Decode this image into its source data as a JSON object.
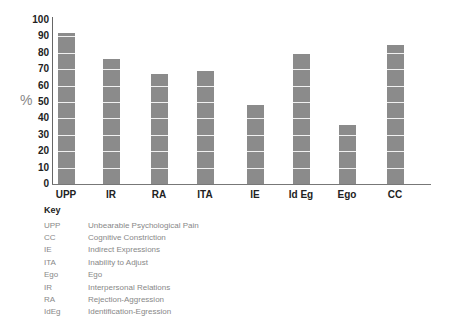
{
  "chart_data": {
    "type": "bar",
    "title": "",
    "xlabel": "",
    "ylabel": "%",
    "ylim": [
      0,
      100
    ],
    "yticks": [
      0,
      10,
      20,
      30,
      40,
      50,
      60,
      70,
      80,
      90,
      100
    ],
    "categories": [
      "UPP",
      "IR",
      "RA",
      "ITA",
      "IE",
      "Id Eg",
      "Ego",
      "CC"
    ],
    "values": [
      92,
      76,
      67,
      69,
      48,
      79,
      36,
      85
    ],
    "grid": false,
    "legend_position": "bottom-left",
    "bar_color": "#8b8b8b"
  },
  "key": {
    "title": "Key",
    "items": [
      {
        "abbr": "UPP",
        "label": "Unbearable Psychological Pain"
      },
      {
        "abbr": "CC",
        "label": "Cognitive Constriction"
      },
      {
        "abbr": "IE",
        "label": "Indirect Expressions"
      },
      {
        "abbr": "ITA",
        "label": "Inability to Adjust"
      },
      {
        "abbr": "Ego",
        "label": "Ego"
      },
      {
        "abbr": "IR",
        "label": "Interpersonal Relations"
      },
      {
        "abbr": "RA",
        "label": "Rejection-Aggression"
      },
      {
        "abbr": "IdEg",
        "label": "Identification-Egression"
      }
    ]
  }
}
